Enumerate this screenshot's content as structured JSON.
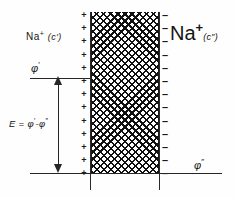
{
  "membrane": {
    "fill_pattern": "cross-hatch",
    "edge_color": "#1a1a1a",
    "left_surface_charge_symbol": "+",
    "right_surface_charge_symbol": "–",
    "left_charge_count": 13,
    "right_charge_count": 13
  },
  "labels": {
    "left_species": {
      "ion": "Na",
      "charge": "+",
      "concentration": "(c′)"
    },
    "right_species": {
      "ion": "Na",
      "charge": "+",
      "concentration": "(c″)"
    },
    "potential_inner": {
      "symbol": "φ",
      "prime": "′"
    },
    "potential_outer": {
      "symbol": "φ",
      "prime": "″"
    },
    "emf": {
      "lhs": "E",
      "equals": " = ",
      "term1": "φ",
      "term1_prime": "′",
      "minus": "-",
      "term2": "φ",
      "term2_prime": "″"
    }
  },
  "colors": {
    "ink": "#151515",
    "line": "#262626",
    "background": "#ffffff"
  }
}
